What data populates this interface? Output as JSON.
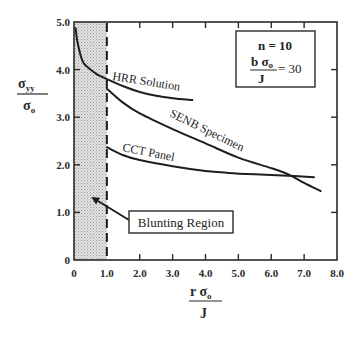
{
  "chart_data": {
    "type": "line",
    "title": "",
    "xlabel": {
      "numerator": "r σ",
      "numerator_sub": "o",
      "denominator": "J"
    },
    "ylabel": {
      "numerator": "σ",
      "numerator_sub": "yy",
      "denominator": "σ",
      "denominator_sub": "o"
    },
    "xlim": [
      0,
      8.0
    ],
    "ylim": [
      0,
      5.0
    ],
    "grid": false,
    "x_ticks": [
      0,
      1.0,
      2.0,
      3.0,
      4.0,
      5.0,
      6.0,
      7.0,
      8.0
    ],
    "x_tick_labels": [
      "0",
      "1.0",
      "2.0",
      "3.0",
      "4.0",
      "5.0",
      "6.0",
      "7.0",
      "8.0"
    ],
    "y_ticks": [
      0,
      1.0,
      2.0,
      3.0,
      4.0,
      5.0
    ],
    "y_tick_labels": [
      "0",
      "1.0",
      "2.0",
      "3.0",
      "4.0",
      "5.0"
    ],
    "series": [
      {
        "name": "HRR Solution",
        "label": "HRR Solution",
        "x": [
          0.05,
          0.1,
          0.2,
          0.3,
          0.5,
          0.7,
          1.0,
          1.5,
          2.0,
          2.5,
          3.0,
          3.6
        ],
        "y": [
          4.87,
          4.6,
          4.3,
          4.13,
          4.0,
          3.9,
          3.8,
          3.65,
          3.53,
          3.45,
          3.4,
          3.36
        ]
      },
      {
        "name": "SENB Specimen",
        "label": "SENB Specimen",
        "x": [
          1.0,
          1.5,
          2.0,
          3.0,
          4.0,
          5.0,
          6.0,
          6.55,
          7.0,
          7.5
        ],
        "y": [
          3.6,
          3.3,
          3.08,
          2.75,
          2.45,
          2.15,
          1.93,
          1.79,
          1.62,
          1.45
        ]
      },
      {
        "name": "CCT Panel",
        "label": "CCT Panel",
        "x": [
          1.0,
          1.5,
          2.0,
          3.0,
          4.0,
          4.7,
          5.5,
          6.5,
          7.3
        ],
        "y": [
          2.37,
          2.2,
          2.1,
          1.97,
          1.87,
          1.83,
          1.8,
          1.77,
          1.74
        ]
      }
    ],
    "shaded_region": {
      "x_from": 0,
      "x_to": 1.0,
      "label": "Blunting Region"
    },
    "vertical_dashed_line": {
      "x": 1.0
    },
    "annotations": {
      "parameter_box": {
        "line1": "n = 10",
        "fraction_num": "b σ",
        "fraction_num_sub": "o",
        "fraction_den": "J",
        "equals": "= 30"
      },
      "blunting_label": "Blunting Region"
    }
  }
}
